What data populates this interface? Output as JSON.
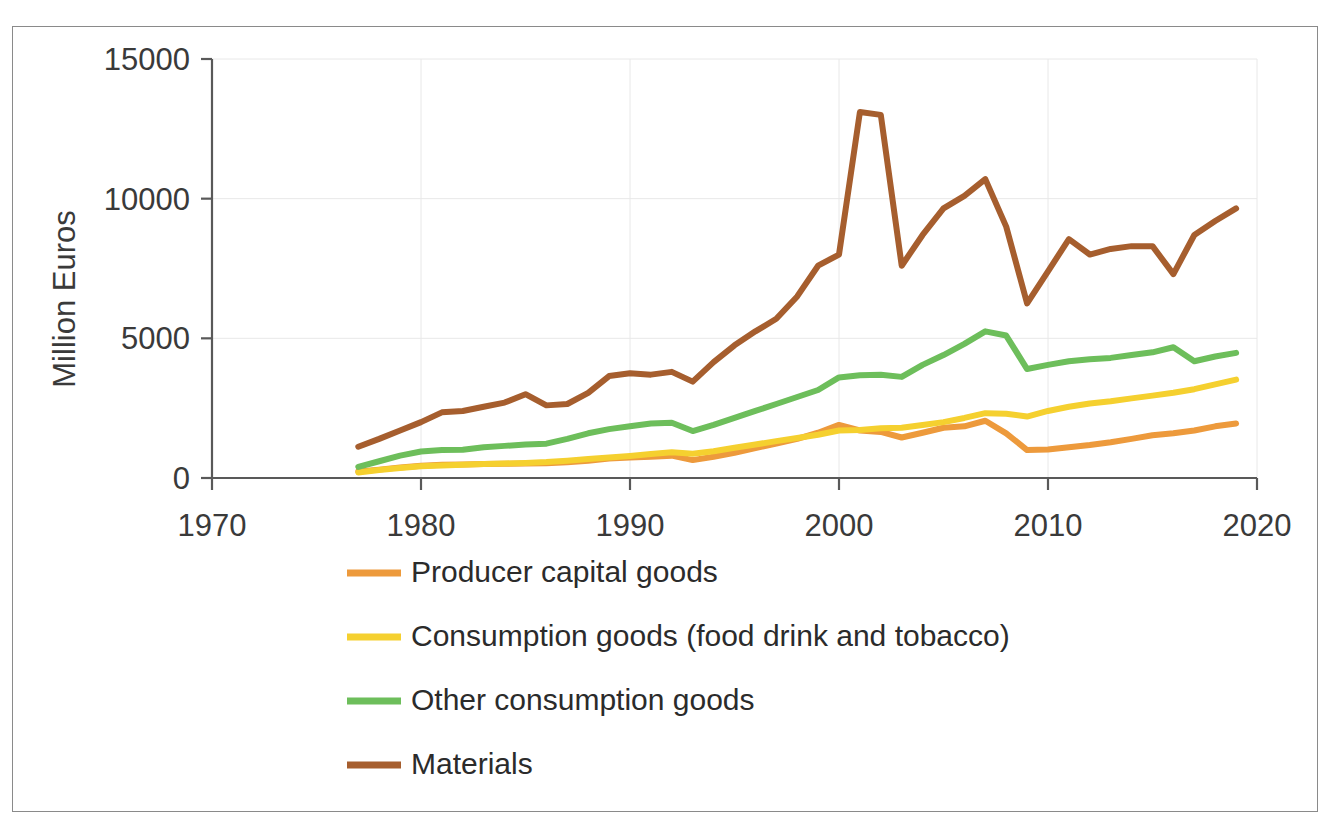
{
  "chart_data": {
    "type": "line",
    "title": "",
    "xlabel": "",
    "ylabel": "Million Euros",
    "xlim": [
      1970,
      2020
    ],
    "ylim": [
      0,
      15000
    ],
    "xticks": [
      1970,
      1980,
      1990,
      2000,
      2010,
      2020
    ],
    "yticks": [
      0,
      5000,
      10000,
      15000
    ],
    "grid": true,
    "legend_position": "bottom-left",
    "x": [
      1977,
      1978,
      1979,
      1980,
      1981,
      1982,
      1983,
      1984,
      1985,
      1986,
      1987,
      1988,
      1989,
      1990,
      1991,
      1992,
      1993,
      1994,
      1995,
      1996,
      1997,
      1998,
      1999,
      2000,
      2001,
      2002,
      2003,
      2004,
      2005,
      2006,
      2007,
      2008,
      2009,
      2010,
      2011,
      2012,
      2013,
      2014,
      2015,
      2016,
      2017,
      2018,
      2019
    ],
    "series": [
      {
        "name": "Producer capital goods",
        "color": "#ED9A3C",
        "values": [
          230,
          300,
          380,
          440,
          470,
          480,
          500,
          510,
          520,
          530,
          560,
          620,
          700,
          730,
          760,
          800,
          640,
          760,
          900,
          1070,
          1230,
          1400,
          1620,
          1900,
          1700,
          1650,
          1450,
          1620,
          1800,
          1850,
          2050,
          1600,
          1000,
          1020,
          1100,
          1180,
          1280,
          1400,
          1530,
          1600,
          1700,
          1850,
          1950
        ]
      },
      {
        "name": "Consumption goods (food drink and tobacco)",
        "color": "#F5D02F",
        "values": [
          200,
          290,
          360,
          420,
          450,
          470,
          500,
          520,
          540,
          570,
          620,
          680,
          730,
          790,
          860,
          920,
          870,
          960,
          1080,
          1200,
          1320,
          1430,
          1550,
          1700,
          1720,
          1780,
          1800,
          1900,
          2000,
          2150,
          2320,
          2300,
          2200,
          2400,
          2550,
          2670,
          2750,
          2850,
          2950,
          3050,
          3180,
          3350,
          3520
        ]
      },
      {
        "name": "Other consumption goods",
        "color": "#6DBE5B",
        "values": [
          400,
          600,
          800,
          950,
          1000,
          1010,
          1100,
          1150,
          1200,
          1230,
          1400,
          1600,
          1750,
          1850,
          1950,
          1980,
          1680,
          1900,
          2150,
          2400,
          2650,
          2900,
          3150,
          3600,
          3680,
          3700,
          3620,
          4050,
          4400,
          4800,
          5250,
          5100,
          3900,
          4050,
          4180,
          4250,
          4300,
          4400,
          4500,
          4680,
          4180,
          4350,
          4480
        ]
      },
      {
        "name": "Materials",
        "color": "#A65E2E",
        "values": [
          1120,
          1400,
          1700,
          2000,
          2350,
          2400,
          2550,
          2700,
          3000,
          2600,
          2650,
          3050,
          3650,
          3750,
          3700,
          3800,
          3450,
          4150,
          4750,
          5250,
          5700,
          6500,
          7600,
          8000,
          13100,
          13000,
          7600,
          8700,
          9650,
          10100,
          10700,
          9000,
          6250,
          7400,
          8550,
          8000,
          8200,
          8300,
          8300,
          7300,
          8700,
          9200,
          9650
        ]
      }
    ]
  },
  "axis": {
    "y_label": "Million Euros",
    "y_ticks": [
      "0",
      "5000",
      "10000",
      "15000"
    ],
    "x_ticks": [
      "1970",
      "1980",
      "1990",
      "2000",
      "2010",
      "2020"
    ]
  },
  "legend": {
    "items": [
      {
        "label": "Producer capital goods",
        "color": "#ED9A3C"
      },
      {
        "label": "Consumption goods (food drink and tobacco)",
        "color": "#F5D02F"
      },
      {
        "label": "Other consumption goods",
        "color": "#6DBE5B"
      },
      {
        "label": "Materials",
        "color": "#A65E2E"
      }
    ]
  }
}
